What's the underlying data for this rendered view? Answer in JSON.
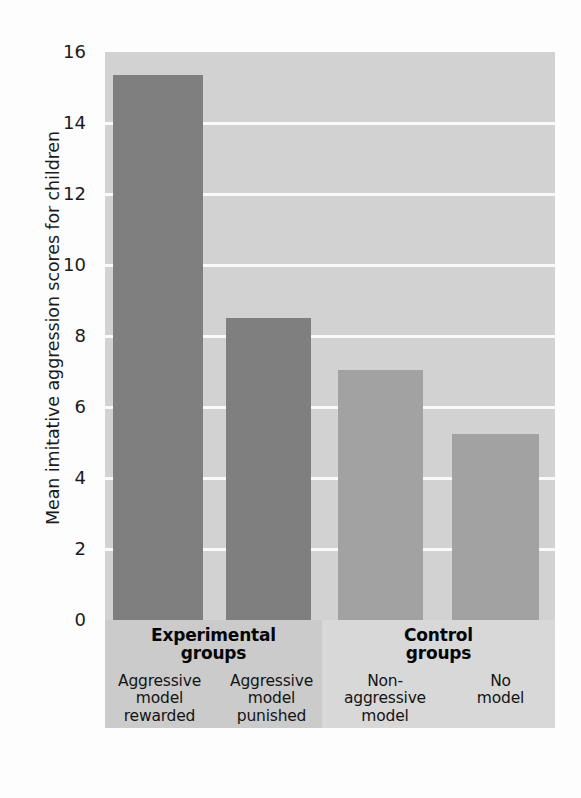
{
  "chart_data": {
    "type": "bar",
    "title": "",
    "subtitle": "",
    "xlabel": "",
    "ylabel": "Mean imitative aggression scores for children",
    "ylim": [
      0,
      16
    ],
    "ytick_labels": [
      "16",
      "14",
      "12",
      "10",
      "8",
      "6",
      "4",
      "2",
      "0"
    ],
    "yticks": [
      16,
      14,
      12,
      10,
      8,
      6,
      4,
      2,
      0
    ],
    "grid": true,
    "gridlines_at": [
      14,
      12,
      10,
      8,
      6,
      4,
      2
    ],
    "legend": "none",
    "categories": [
      "Aggressive model rewarded",
      "Aggressive model punished",
      "Non-aggressive model",
      "No model"
    ],
    "values": [
      15.35,
      8.5,
      7.05,
      5.25
    ],
    "bars": [
      {
        "label_lines": [
          "Aggressive",
          "model",
          "rewarded"
        ],
        "value": 15.35,
        "group": "Experimental groups",
        "color": "#7f7f7f"
      },
      {
        "label_lines": [
          "Aggressive",
          "model",
          "punished"
        ],
        "value": 8.5,
        "group": "Experimental groups",
        "color": "#7f7f7f"
      },
      {
        "label_lines": [
          "Non-",
          "aggressive",
          "model"
        ],
        "value": 7.05,
        "group": "Control groups",
        "color": "#a2a2a2"
      },
      {
        "label_lines": [
          "No",
          "model"
        ],
        "value": 5.25,
        "group": "Control groups",
        "color": "#a2a2a2"
      }
    ],
    "groups": [
      {
        "heading_lines": [
          "Experimental",
          "groups"
        ],
        "bar_indices": [
          0,
          1
        ]
      },
      {
        "heading_lines": [
          "Control",
          "groups"
        ],
        "bar_indices": [
          2,
          3
        ]
      }
    ]
  },
  "axis": {
    "y_title": "Mean imitative aggression scores for children",
    "tick_16": "16",
    "tick_14": "14",
    "tick_12": "12",
    "tick_10": "10",
    "tick_8": "8",
    "tick_6": "6",
    "tick_4": "4",
    "tick_2": "2",
    "tick_0": "0"
  },
  "groups": {
    "experimental": {
      "heading_line1": "Experimental",
      "heading_line2": "groups"
    },
    "control": {
      "heading_line1": "Control",
      "heading_line2": "groups"
    }
  },
  "captions": {
    "bar1_line1": "Aggressive",
    "bar1_line2": "model",
    "bar1_line3": "rewarded",
    "bar2_line1": "Aggressive",
    "bar2_line2": "model",
    "bar2_line3": "punished",
    "bar3_line1": "Non-",
    "bar3_line2": "aggressive",
    "bar3_line3": "model",
    "bar4_line1": "No",
    "bar4_line2": "model"
  },
  "colors": {
    "plot_background": "#d2d2d2",
    "gridline": "#fafafa",
    "experimental_bar": "#7f7f7f",
    "control_bar": "#a2a2a2",
    "experimental_band": "#cbcbcb",
    "control_band": "#d8d8d8",
    "text": "#141414",
    "page_background": "#fdfdfd"
  }
}
